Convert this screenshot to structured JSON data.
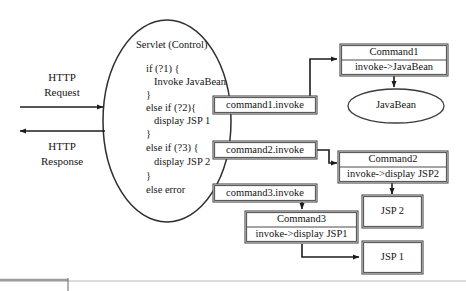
{
  "diagram": {
    "controller": {
      "label": "Servlet (Control)",
      "code_lines": [
        "if (?1) {",
        "Invoke JavaBean",
        "}",
        "else if (?2){",
        "display JSP 1",
        "}",
        "else if (?3) {",
        "display JSP 2",
        "}",
        "else error"
      ]
    },
    "http": {
      "request_line1": "HTTP",
      "request_line2": "Request",
      "response_line1": "HTTP",
      "response_line2": "Response"
    },
    "invoke_boxes": [
      {
        "label": "command1.invoke"
      },
      {
        "label": "command2.invoke"
      },
      {
        "label": "command3.invoke"
      }
    ],
    "command_boxes": [
      {
        "title": "Command1",
        "action": "invoke->JavaBean"
      },
      {
        "title": "Command2",
        "action": "invoke->display JSP2"
      },
      {
        "title": "Command3",
        "action": "invoke->display JSP1"
      }
    ],
    "targets": [
      {
        "label": "JavaBean",
        "shape": "ellipse"
      },
      {
        "label": "JSP 2",
        "shape": "rect"
      },
      {
        "label": "JSP 1",
        "shape": "rect"
      }
    ],
    "colors": {
      "stroke": "#2b2b2b",
      "box_stroke": "#4a4a4a",
      "text": "#141414",
      "background": "#ffffff",
      "rule": "#b9b9b9"
    }
  }
}
